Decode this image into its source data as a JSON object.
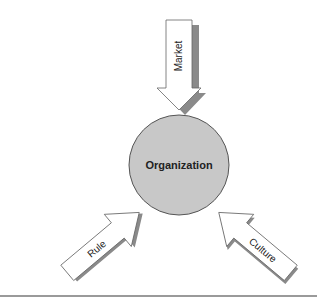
{
  "diagram": {
    "center": {
      "label": "Organization",
      "fill": "#c8c8c8",
      "stroke": "#555555"
    },
    "arrows": [
      {
        "id": "market",
        "label": "Market",
        "direction": "down",
        "points_to": "Organization"
      },
      {
        "id": "rule",
        "label": "Rule",
        "direction": "up-right",
        "points_to": "Organization"
      },
      {
        "id": "culture",
        "label": "Culture",
        "direction": "up-left",
        "points_to": "Organization"
      }
    ],
    "colors": {
      "arrow_fill": "#ffffff",
      "arrow_stroke": "#666666",
      "shadow": "#8a8a8a",
      "rule_line": "#9a9a9a"
    }
  }
}
